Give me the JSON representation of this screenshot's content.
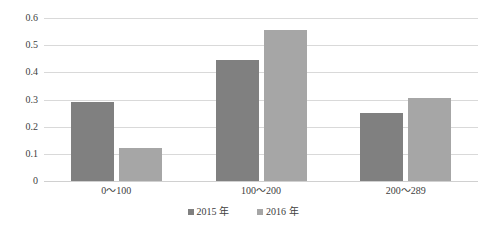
{
  "top_clipped_text": "—— ——— —————— —— ———",
  "legend": {
    "position": "bottom-center",
    "entries": [
      {
        "label": "2015 年",
        "color": "#808080",
        "swatch": "square-marker"
      },
      {
        "label": "2016 年",
        "color": "#a6a6a6",
        "swatch": "square-marker"
      }
    ]
  },
  "axis": {
    "y_ticks": [
      "0.6",
      "0.5",
      "0.4",
      "0.3",
      "0.2",
      "0.1",
      "0"
    ],
    "x_labels": [
      "0～100",
      "100～200",
      "200～289"
    ]
  },
  "chart_data": {
    "type": "bar",
    "title": "",
    "subtitle": "",
    "xlabel": "",
    "ylabel": "",
    "ylim": [
      0,
      0.6
    ],
    "ytick_values": [
      0.6,
      0.5,
      0.4,
      0.3,
      0.2,
      0.1,
      0
    ],
    "grid": true,
    "grid_axis": "y",
    "legend_position": "bottom-center",
    "categories": [
      "0～100",
      "100～200",
      "200～289"
    ],
    "series": [
      {
        "name": "2015 年",
        "color": "#808080",
        "values": [
          0.29,
          0.445,
          0.25
        ]
      },
      {
        "name": "2016 年",
        "color": "#a6a6a6",
        "values": [
          0.12,
          0.555,
          0.305
        ]
      }
    ]
  }
}
